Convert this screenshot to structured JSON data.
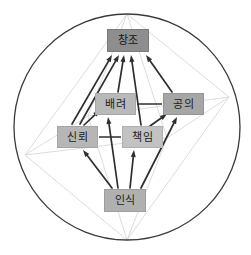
{
  "figure": {
    "type": "directed-graph-octahedron",
    "background_color": "#ffffff",
    "circle": {
      "name": "boundary-circle",
      "cx": 127,
      "cy": 127,
      "r": 113,
      "stroke": "#3b3b3b",
      "stroke_width": 1.3,
      "fill": "none"
    },
    "wireframe": {
      "stroke": "#d8d8d8",
      "stroke_width": 0.9,
      "vertices": {
        "top": {
          "x": 127,
          "y": 14
        },
        "bottom": {
          "x": 127,
          "y": 240
        },
        "left": {
          "x": 25,
          "y": 155
        },
        "right": {
          "x": 229,
          "y": 97
        },
        "front": {
          "x": 88,
          "y": 116
        },
        "back": {
          "x": 167,
          "y": 138
        }
      },
      "edges": [
        [
          "top",
          "left"
        ],
        [
          "top",
          "right"
        ],
        [
          "top",
          "front"
        ],
        [
          "top",
          "back"
        ],
        [
          "bottom",
          "left"
        ],
        [
          "bottom",
          "right"
        ],
        [
          "bottom",
          "front"
        ],
        [
          "bottom",
          "back"
        ],
        [
          "left",
          "front"
        ],
        [
          "front",
          "right"
        ],
        [
          "right",
          "back"
        ],
        [
          "back",
          "left"
        ]
      ]
    }
  },
  "nodes": [
    {
      "id": "changjo",
      "label": "창조",
      "x": 107,
      "y": 29,
      "w": 42,
      "h": 23,
      "fill": "#8e8e8e",
      "text_color": "#151515",
      "border": "#7a7a7a"
    },
    {
      "id": "baeryeo",
      "label": "배려",
      "x": 95,
      "y": 93,
      "w": 41,
      "h": 22,
      "fill": "#b9b9b9",
      "text_color": "#1c1c1c",
      "border": "#a8a8a8"
    },
    {
      "id": "gongui",
      "label": "공의",
      "x": 163,
      "y": 93,
      "w": 41,
      "h": 22,
      "fill": "#a6a6a6",
      "text_color": "#1c1c1c",
      "border": "#949494"
    },
    {
      "id": "sinroe",
      "label": "신뢰",
      "x": 57,
      "y": 126,
      "w": 41,
      "h": 22,
      "fill": "#b6b6b6",
      "text_color": "#1c1c1c",
      "border": "#a4a4a4"
    },
    {
      "id": "chaegim",
      "label": "책임",
      "x": 122,
      "y": 126,
      "w": 41,
      "h": 22,
      "fill": "#c2c2c2",
      "text_color": "#1c1c1c",
      "border": "#b0b0b0"
    },
    {
      "id": "insik",
      "label": "인식",
      "x": 104,
      "y": 189,
      "w": 42,
      "h": 23,
      "fill": "#b0b0b0",
      "text_color": "#1c1c1c",
      "border": "#9e9e9e"
    }
  ],
  "arrows": {
    "stroke": "#2e2e2e",
    "stroke_width": 1.7,
    "head_length": 7,
    "head_width": 5,
    "list": [
      {
        "from": "sinroe",
        "to": "changjo",
        "x1": 72,
        "y1": 124,
        "x2": 112,
        "y2": 55
      },
      {
        "from": "sinroe",
        "to": "changjo",
        "x1": 80,
        "y1": 124,
        "x2": 119,
        "y2": 55
      },
      {
        "from": "baeryeo",
        "to": "changjo",
        "x1": 118,
        "y1": 92,
        "x2": 124,
        "y2": 55
      },
      {
        "from": "chaegim",
        "to": "changjo",
        "x1": 141,
        "y1": 125,
        "x2": 131,
        "y2": 55
      },
      {
        "from": "gongui",
        "to": "changjo",
        "x1": 172,
        "y1": 92,
        "x2": 146,
        "y2": 55
      },
      {
        "from": "sinroe",
        "to": "baeryeo",
        "x1": 84,
        "y1": 125,
        "x2": 100,
        "y2": 110
      },
      {
        "from": "insik",
        "to": "sinroe",
        "x1": 112,
        "y1": 188,
        "x2": 83,
        "y2": 150
      },
      {
        "from": "insik",
        "to": "baeryeo",
        "x1": 118,
        "y1": 188,
        "x2": 108,
        "y2": 117
      },
      {
        "from": "insik",
        "to": "chaegim",
        "x1": 130,
        "y1": 188,
        "x2": 134,
        "y2": 150
      },
      {
        "from": "insik",
        "to": "gongui",
        "x1": 141,
        "y1": 188,
        "x2": 177,
        "y2": 117
      },
      {
        "from": "chaegim",
        "to": "gongui",
        "x1": 150,
        "y1": 126,
        "x2": 167,
        "y2": 114
      }
    ]
  },
  "connectors": {
    "stroke": "#2e2e2e",
    "stroke_width": 1.5,
    "list": [
      {
        "from": "baeryeo",
        "to": "gongui",
        "x1": 137,
        "y1": 104,
        "x2": 162,
        "y2": 104
      },
      {
        "from": "sinroe",
        "to": "chaegim",
        "x1": 99,
        "y1": 137,
        "x2": 121,
        "y2": 137
      }
    ]
  }
}
